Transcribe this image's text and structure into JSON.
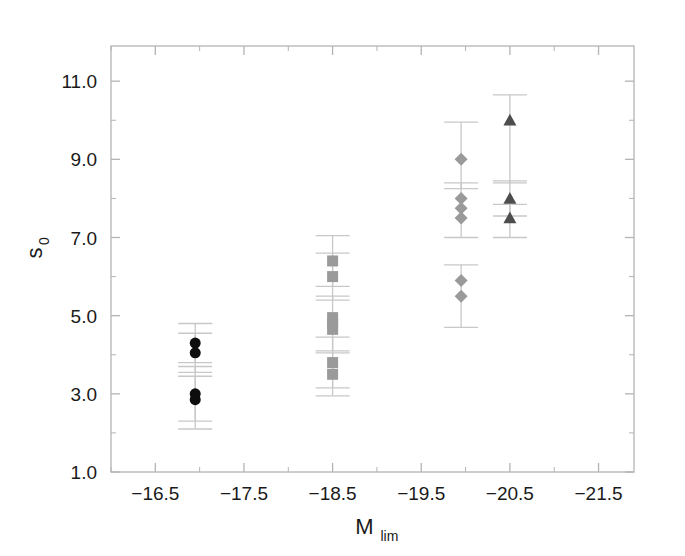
{
  "figure": {
    "background_color": "#ffffff",
    "frame_color": "#aeaeae",
    "tick_color": "#b4b4b4",
    "errorbar_color": "#c8c8c8",
    "text_color": "#1a1a1a"
  },
  "chart_data": {
    "type": "scatter",
    "title": "",
    "xlabel": "M_lim",
    "xlabel_base": "M",
    "xlabel_sub": "lim",
    "ylabel": "s_0",
    "ylabel_base": "s",
    "ylabel_sub": "0",
    "xlim": [
      -16.0,
      -21.9
    ],
    "ylim": [
      1.0,
      11.9
    ],
    "x_inverted": true,
    "grid": false,
    "legend": "none",
    "xticks": [
      -16.5,
      -17.5,
      -18.5,
      -19.5,
      -20.5,
      -21.5
    ],
    "xtick_labels": [
      "−16.5",
      "−17.5",
      "−18.5",
      "−19.5",
      "−20.5",
      "−21.5"
    ],
    "xminor_step": 0.5,
    "yticks": [
      11.0,
      9.0,
      7.0,
      5.0,
      3.0,
      1.0
    ],
    "ytick_labels": [
      "11.0",
      "9.0",
      "7.0",
      "5.0",
      "3.0",
      "1.0"
    ],
    "yminor_step": 1.0,
    "series": [
      {
        "name": "circles",
        "marker": "circle",
        "color": "#0d0d0d",
        "size": 11,
        "x": -16.95,
        "points": [
          {
            "x": -16.95,
            "y": 4.3
          },
          {
            "x": -16.95,
            "y": 4.05
          },
          {
            "x": -16.95,
            "y": 3.0
          },
          {
            "x": -16.95,
            "y": 2.85
          }
        ],
        "errorbars": [
          {
            "x": -16.95,
            "y": 4.3,
            "lo": 3.8,
            "hi": 4.8
          },
          {
            "x": -16.95,
            "y": 4.05,
            "lo": 3.55,
            "hi": 4.55
          },
          {
            "x": -16.95,
            "y": 3.0,
            "lo": 2.3,
            "hi": 3.7
          },
          {
            "x": -16.95,
            "y": 2.85,
            "lo": 2.1,
            "hi": 3.45
          }
        ]
      },
      {
        "name": "squares",
        "marker": "square",
        "color": "#9a9a9a",
        "size": 11,
        "x": -18.5,
        "points": [
          {
            "x": -18.5,
            "y": 6.4
          },
          {
            "x": -18.5,
            "y": 6.0
          },
          {
            "x": -18.5,
            "y": 4.95
          },
          {
            "x": -18.5,
            "y": 4.8
          },
          {
            "x": -18.5,
            "y": 4.65
          },
          {
            "x": -18.5,
            "y": 3.8
          },
          {
            "x": -18.5,
            "y": 3.5
          }
        ],
        "errorbars": [
          {
            "x": -18.5,
            "y": 6.4,
            "lo": 5.75,
            "hi": 7.05
          },
          {
            "x": -18.5,
            "y": 6.0,
            "lo": 5.4,
            "hi": 6.6
          },
          {
            "x": -18.5,
            "y": 4.8,
            "lo": 4.1,
            "hi": 5.5
          },
          {
            "x": -18.5,
            "y": 3.8,
            "lo": 3.15,
            "hi": 4.45
          },
          {
            "x": -18.5,
            "y": 3.5,
            "lo": 2.95,
            "hi": 4.05
          }
        ]
      },
      {
        "name": "diamonds",
        "marker": "diamond",
        "color": "#9a9a9a",
        "size": 13,
        "x": -19.95,
        "points": [
          {
            "x": -19.95,
            "y": 9.0
          },
          {
            "x": -19.95,
            "y": 8.0
          },
          {
            "x": -19.95,
            "y": 7.75
          },
          {
            "x": -19.95,
            "y": 7.5
          },
          {
            "x": -19.95,
            "y": 5.9
          },
          {
            "x": -19.95,
            "y": 5.5
          }
        ],
        "errorbars": [
          {
            "x": -19.95,
            "y": 9.0,
            "lo": 8.25,
            "hi": 9.95
          },
          {
            "x": -19.95,
            "y": 7.75,
            "lo": 7.0,
            "hi": 8.4
          },
          {
            "x": -19.95,
            "y": 5.7,
            "lo": 4.7,
            "hi": 6.3
          }
        ]
      },
      {
        "name": "triangles",
        "marker": "triangle",
        "color": "#4d4d4d",
        "size": 13,
        "x": -20.5,
        "points": [
          {
            "x": -20.5,
            "y": 10.0
          },
          {
            "x": -20.5,
            "y": 8.0
          },
          {
            "x": -20.5,
            "y": 7.5
          }
        ],
        "errorbars": [
          {
            "x": -20.5,
            "y": 10.0,
            "lo": 8.4,
            "hi": 10.65
          },
          {
            "x": -20.5,
            "y": 8.0,
            "lo": 7.55,
            "hi": 8.45
          },
          {
            "x": -20.5,
            "y": 7.5,
            "lo": 7.0,
            "hi": 7.85
          }
        ]
      }
    ]
  }
}
